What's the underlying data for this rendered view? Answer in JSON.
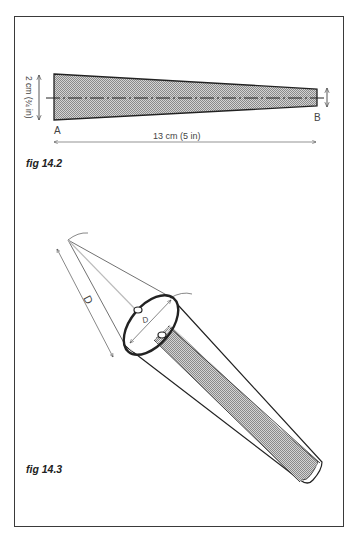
{
  "figures": [
    {
      "id": "fig_14_2",
      "caption": "fig 14.2",
      "description": "Tapered strip template, shaded, with dash-dot centre line",
      "labels": {
        "end_a": "A",
        "end_b": "B",
        "width_dimension": "2 cm (¾ in)",
        "length_dimension": "13 cm (5 in)"
      }
    },
    {
      "id": "fig_14_3",
      "caption": "fig 14.3",
      "description": "Cone formed from strip with ring at wide end; construction lines to apex",
      "labels": {
        "slant_length": "D",
        "ring_diameter": "D"
      }
    }
  ],
  "colors": {
    "line": "#2a2a2a",
    "fill_shade": "#bdbdbd",
    "frame": "#3a3a3a",
    "background": "#ffffff"
  }
}
